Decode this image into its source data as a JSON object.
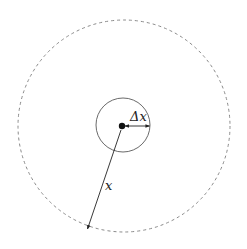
{
  "diagram": {
    "outer_circle": {
      "cx": 124,
      "cy": 126,
      "r": 106,
      "style": "dashed",
      "color": "#8a8a8a"
    },
    "inner_circle": {
      "cx": 123,
      "cy": 125,
      "r": 27,
      "style": "solid",
      "color": "#6a6a6a"
    },
    "center_dot": {
      "cx": 122,
      "cy": 126,
      "r": 3.2,
      "color": "#111111"
    },
    "labels": {
      "delta_x": "Δx",
      "x": "x"
    },
    "arrows": [
      {
        "name": "delta-x-arrow",
        "from": [
          125,
          126
        ],
        "to": [
          150,
          126
        ]
      },
      {
        "name": "x-arrow",
        "from": [
          122,
          128
        ],
        "to": [
          87,
          230
        ]
      }
    ]
  }
}
